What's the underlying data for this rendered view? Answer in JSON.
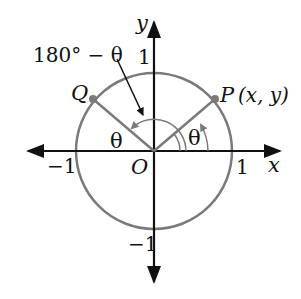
{
  "diagram": {
    "axes": {
      "x_label": "x",
      "y_label": "y",
      "origin_label": "O"
    },
    "ticks": {
      "x_pos": "1",
      "x_neg": "−1",
      "y_pos": "1",
      "y_neg": "−1"
    },
    "points": {
      "P": {
        "label": "P",
        "coords": "(x, y)"
      },
      "Q": {
        "label": "Q"
      }
    },
    "angles": {
      "theta": "θ",
      "supplement": "180° − θ"
    },
    "colors": {
      "axes": "#111111",
      "circle": "#7a7a7a"
    }
  }
}
